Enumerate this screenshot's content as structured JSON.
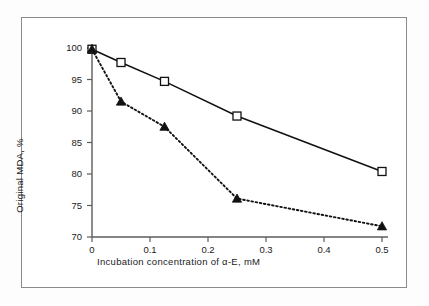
{
  "figure": {
    "background_color": "#fdfdfd",
    "frame_color": "#8a8a8a",
    "ink_color": "#1a1a1a"
  },
  "chart_data": {
    "type": "line",
    "title": "",
    "xlabel": "Incubation concentration of α-E, mM",
    "ylabel": "Original MDA, %",
    "xlim": [
      0,
      0.5
    ],
    "ylim": [
      70,
      100
    ],
    "xticks": [
      0,
      0.1,
      0.2,
      0.3,
      0.4,
      0.5
    ],
    "xticklabels": [
      "0",
      "0.1",
      "0.2",
      "0.3",
      "0.4",
      "0.5"
    ],
    "yticks": [
      70,
      75,
      80,
      85,
      90,
      95,
      100
    ],
    "yticklabels": [
      "70",
      "75",
      "80",
      "85",
      "90",
      "95",
      "100"
    ],
    "grid": false,
    "legend": "none",
    "x": [
      0,
      0.05,
      0.125,
      0.25,
      0.5
    ],
    "series": [
      {
        "name": "open-square-solid",
        "marker": "open-square",
        "linestyle": "solid",
        "color": "#111111",
        "values": [
          99.8,
          97.7,
          94.7,
          89.2,
          80.4
        ]
      },
      {
        "name": "filled-triangle-dotted",
        "marker": "filled-triangle",
        "linestyle": "dotted",
        "color": "#111111",
        "values": [
          99.8,
          91.5,
          87.5,
          76.1,
          71.7
        ]
      }
    ]
  }
}
